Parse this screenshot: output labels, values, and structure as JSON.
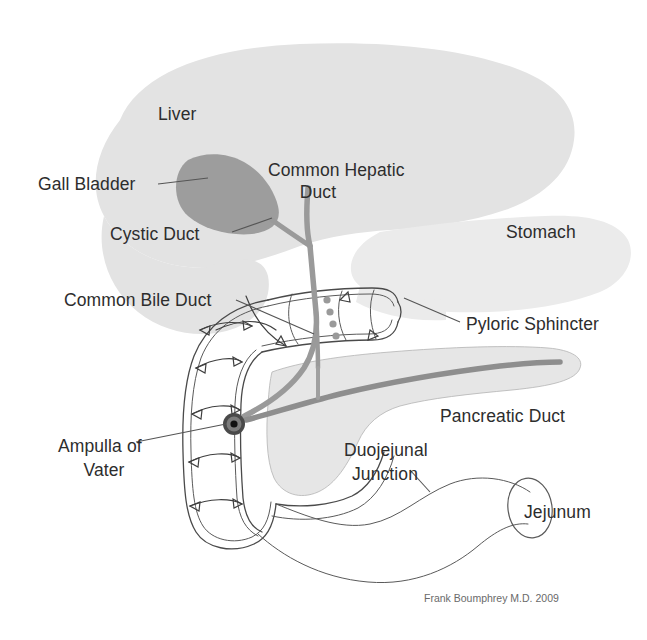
{
  "diagram": {
    "credit": "Frank Boumphrey M.D. 2009",
    "background_color": "#ffffff",
    "labels": {
      "liver": "Liver",
      "gall_bladder": "Gall Bladder",
      "cystic_duct": "Cystic Duct",
      "common_hepatic_duct_line1": "Common Hepatic",
      "common_hepatic_duct_line2": "Duct",
      "common_bile_duct": "Common Bile Duct",
      "stomach": "Stomach",
      "pyloric_sphincter": "Pyloric Sphincter",
      "pancreatic_duct": "Pancreatic Duct",
      "ampulla_of_vater_line1": "Ampulla of",
      "ampulla_of_vater_line2": "Vater",
      "duojejunal_junction_line1": "Duojejunal",
      "duojejunal_junction_line2": "Junction",
      "jejunum": "Jejunum"
    },
    "colors": {
      "liver_fill": "#e3e3e3",
      "gall_bladder_fill": "#9d9d9d",
      "stomach_fill": "#ebebeb",
      "pancreas_fill": "#e6e6e6",
      "duct_gray": "#9a9a9a",
      "pancreatic_duct_gray": "#8e8e8e",
      "outline_stroke": "#4a4a4a",
      "label_text": "#2d2d2d",
      "credit_text": "#6a6a6a",
      "ampulla_ring": "#3a3a3a",
      "ampulla_center": "#111111"
    }
  }
}
